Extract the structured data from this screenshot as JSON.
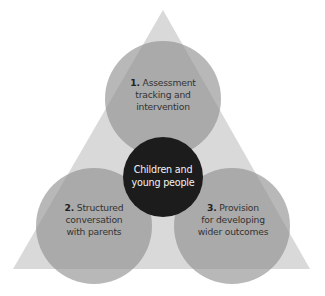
{
  "diagram": {
    "title": "",
    "colors": {
      "background": "#ffffff",
      "triangle": "#d9d9d9",
      "circle": "#8c8c8c",
      "circle_opacity": 0.62,
      "center_circle": "#1c1c1c",
      "text": "#333333",
      "center_text": "#f2f2f2"
    },
    "center": {
      "line1": "Children and",
      "line2": "young people"
    },
    "nodes": [
      {
        "number": "1.",
        "line1": "Assessment",
        "line2": "tracking and",
        "line3": "intervention"
      },
      {
        "number": "2.",
        "line1": "Structured",
        "line2": "conversation",
        "line3": "with parents"
      },
      {
        "number": "3.",
        "line1": "Provision",
        "line2": "for developing",
        "line3": "wider outcomes"
      }
    ]
  }
}
